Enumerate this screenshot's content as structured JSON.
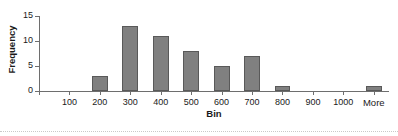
{
  "chart_data": {
    "type": "bar",
    "title": "",
    "xlabel": "Bin",
    "ylabel": "Frequency",
    "categories": [
      "100",
      "200",
      "300",
      "400",
      "500",
      "600",
      "700",
      "800",
      "900",
      "1000",
      "More"
    ],
    "values": [
      0,
      3,
      13,
      11,
      8,
      5,
      7,
      1,
      0,
      0,
      1
    ],
    "ylim": [
      0,
      15
    ],
    "y_ticks": [
      0,
      5,
      10,
      15
    ],
    "y_tick_labels": [
      "0",
      "5",
      "10",
      "15"
    ],
    "x_tick_labels": [
      "100",
      "200",
      "300",
      "400",
      "500",
      "600",
      "700",
      "800",
      "900",
      "1000",
      "More"
    ],
    "grid": false,
    "legend": false,
    "bar_color": "#808080",
    "bar_border_color": "#595959",
    "axis_color": "#6e6e6e",
    "background": "#ffffff"
  }
}
